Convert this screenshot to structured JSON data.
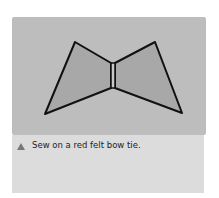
{
  "illustration": {
    "subject": "bow tie drawing",
    "background_color": "#bdbdbd",
    "fill_color": "#a9a9a9",
    "outline_color": "#111111"
  },
  "caption": {
    "icon": "triangle-icon",
    "text": "Sew on a red felt bow tie."
  }
}
